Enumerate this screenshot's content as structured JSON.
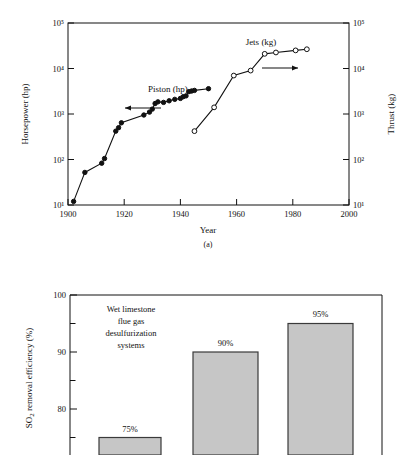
{
  "figure": {
    "caption_a": "(a)"
  },
  "chart_data": [
    {
      "id": "engine-power-chart",
      "type": "line",
      "title": "",
      "xlabel": "Year",
      "ylabel": "Horsepower (hp)",
      "y2label": "Thrust (kg)",
      "xlim": [
        1900,
        2000
      ],
      "xticks": [
        1900,
        1920,
        1940,
        1960,
        1980,
        2000
      ],
      "xticklabels": [
        "1900",
        "1920",
        "1940",
        "1960",
        "1980",
        "2000"
      ],
      "ylim": [
        10,
        100000
      ],
      "yscale": "log",
      "yticks": [
        10,
        100,
        1000,
        10000,
        100000
      ],
      "yticklabels": [
        "10¹",
        "10²",
        "10³",
        "10⁴",
        "10⁵"
      ],
      "y2lim": [
        10,
        100000
      ],
      "y2scale": "log",
      "y2ticks": [
        10,
        100,
        1000,
        10000,
        100000
      ],
      "y2ticklabels": [
        "10¹",
        "10²",
        "10³",
        "10⁴",
        "10⁵"
      ],
      "grid": false,
      "legend": "none",
      "annotations": [
        {
          "text": "Piston (hp)",
          "x": 1932,
          "y": 6000
        },
        {
          "text": "Jets (kg)",
          "x": 1968,
          "y": 48000
        },
        {
          "text": "←",
          "x": 1918,
          "y": 1500
        },
        {
          "text": "→",
          "x": 1976,
          "y": 13000
        }
      ],
      "series": [
        {
          "name": "Piston (hp)",
          "marker": "filled-circle",
          "axis": "left",
          "points": [
            [
              1902,
              12
            ],
            [
              1906,
              52
            ],
            [
              1912,
              83
            ],
            [
              1913,
              105
            ],
            [
              1917,
              420
            ],
            [
              1918,
              500
            ],
            [
              1919,
              640
            ],
            [
              1927,
              950
            ],
            [
              1929,
              1100
            ],
            [
              1930,
              1280
            ],
            [
              1931,
              1700
            ],
            [
              1932,
              1850
            ],
            [
              1934,
              1800
            ],
            [
              1936,
              1950
            ],
            [
              1938,
              2100
            ],
            [
              1940,
              2200
            ],
            [
              1941,
              2400
            ],
            [
              1942,
              2500
            ],
            [
              1943,
              3100
            ],
            [
              1944,
              3200
            ],
            [
              1945,
              3300
            ],
            [
              1950,
              3600
            ]
          ]
        },
        {
          "name": "Jets (kg)",
          "marker": "open-circle",
          "axis": "right",
          "points": [
            [
              1945,
              420
            ],
            [
              1952,
              1400
            ],
            [
              1959,
              7000
            ],
            [
              1965,
              9000
            ],
            [
              1970,
              21000
            ],
            [
              1974,
              22500
            ],
            [
              1981,
              25000
            ],
            [
              1985,
              26500
            ]
          ]
        }
      ]
    },
    {
      "id": "so2-removal-chart",
      "type": "bar",
      "title": "",
      "xlabel": "",
      "ylabel": "SO₂ removal efficiency (%)",
      "ylim": [
        72,
        100
      ],
      "yticks": [
        75,
        80,
        85,
        90,
        95,
        100
      ],
      "yticklabels": [
        "",
        "80",
        "",
        "90",
        "",
        "100"
      ],
      "grid": false,
      "legend": "none",
      "categories": [
        "",
        "",
        ""
      ],
      "values": [
        75,
        90,
        95
      ],
      "value_labels": [
        "75%",
        "90%",
        "95%"
      ],
      "bar_color": "#c6c6c6",
      "bar_edge_color": "#3a3a3a",
      "annotations": [
        {
          "text": "Wet limestone",
          "line": 1
        },
        {
          "text": "flue gas",
          "line": 2
        },
        {
          "text": "desulfurization",
          "line": 3
        },
        {
          "text": "systems",
          "line": 4
        }
      ]
    }
  ]
}
